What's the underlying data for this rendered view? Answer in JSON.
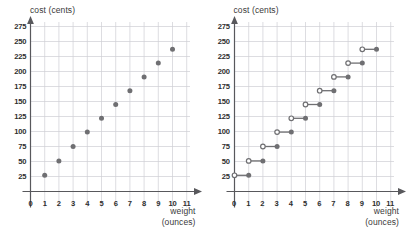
{
  "chart_data": [
    {
      "type": "scatter",
      "title": "",
      "ylabel": "cost (cents)",
      "xlabel": "weight (ounces)",
      "xlabel_line1": "weight",
      "xlabel_line2": "(ounces)",
      "xlim": [
        0,
        11.6
      ],
      "ylim": [
        0,
        287
      ],
      "xticks": [
        0,
        1,
        2,
        3,
        4,
        5,
        6,
        7,
        8,
        9,
        10,
        11
      ],
      "yticks": [
        25,
        50,
        75,
        100,
        125,
        150,
        175,
        200,
        225,
        250,
        275
      ],
      "grid": true,
      "x": [
        1,
        2,
        3,
        4,
        5,
        6,
        7,
        8,
        9,
        10
      ],
      "values": [
        27,
        51,
        75,
        99,
        122,
        145,
        168,
        191,
        214,
        237
      ],
      "marker": "filled-circle",
      "marker_color": "#6f6f72",
      "grid_color": "#cfcfd4",
      "axis_color": "#58585c"
    },
    {
      "type": "line",
      "subtype": "step",
      "title": "",
      "ylabel": "cost (cents)",
      "xlabel": "weight (ounces)",
      "xlabel_line1": "weight",
      "xlabel_line2": "(ounces)",
      "xlim": [
        0,
        11.6
      ],
      "ylim": [
        0,
        287
      ],
      "xticks": [
        0,
        1,
        2,
        3,
        4,
        5,
        6,
        7,
        8,
        9,
        10,
        11
      ],
      "yticks": [
        25,
        50,
        75,
        100,
        125,
        150,
        175,
        200,
        225,
        250,
        275
      ],
      "grid": true,
      "segments": [
        {
          "x_start": 0,
          "x_end": 1,
          "y": 27
        },
        {
          "x_start": 1,
          "x_end": 2,
          "y": 51
        },
        {
          "x_start": 2,
          "x_end": 3,
          "y": 75
        },
        {
          "x_start": 3,
          "x_end": 4,
          "y": 99
        },
        {
          "x_start": 4,
          "x_end": 5,
          "y": 122
        },
        {
          "x_start": 5,
          "x_end": 6,
          "y": 145
        },
        {
          "x_start": 6,
          "x_end": 7,
          "y": 168
        },
        {
          "x_start": 7,
          "x_end": 8,
          "y": 191
        },
        {
          "x_start": 8,
          "x_end": 9,
          "y": 214
        },
        {
          "x_start": 9,
          "x_end": 10,
          "y": 237
        }
      ],
      "left_endpoint": "open-circle",
      "right_endpoint": "filled-circle",
      "marker_color": "#6f6f72",
      "grid_color": "#cfcfd4",
      "axis_color": "#58585c"
    }
  ]
}
